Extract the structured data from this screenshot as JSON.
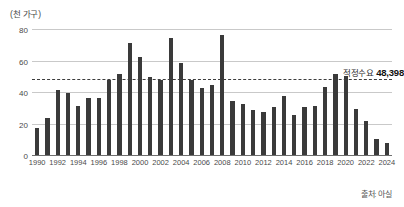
{
  "chart_data": {
    "type": "bar",
    "title": "",
    "subtitle": "",
    "unit_label": "(천 가구)",
    "xlabel": "",
    "ylabel": "",
    "ylim": [
      0,
      80
    ],
    "y_ticks": [
      0,
      20,
      40,
      60,
      80
    ],
    "grid": true,
    "legend_position": "none",
    "x": [
      1990,
      1991,
      1992,
      1993,
      1994,
      1995,
      1996,
      1997,
      1998,
      1999,
      2000,
      2001,
      2002,
      2003,
      2004,
      2005,
      2006,
      2007,
      2008,
      2009,
      2010,
      2011,
      2012,
      2013,
      2014,
      2015,
      2016,
      2017,
      2018,
      2019,
      2020,
      2021,
      2022,
      2023,
      2024
    ],
    "x_tick_labels": [
      "1990",
      "1992",
      "1994",
      "1996",
      "1998",
      "2000",
      "2002",
      "2004",
      "2006",
      "2008",
      "2010",
      "2012",
      "2014",
      "2016",
      "2018",
      "2020",
      "2022",
      "2024"
    ],
    "values": [
      18,
      24,
      42,
      40,
      32,
      37,
      37,
      48,
      52,
      72,
      63,
      50,
      48,
      75,
      59,
      48,
      43,
      45,
      77,
      35,
      33,
      29,
      28,
      31,
      38,
      26,
      31,
      32,
      44,
      52,
      51,
      30,
      22,
      11,
      8
    ],
    "series": [
      {
        "name": "아파트 입주물량",
        "values": [
          18,
          24,
          42,
          40,
          32,
          37,
          37,
          48,
          52,
          72,
          63,
          50,
          48,
          75,
          59,
          48,
          43,
          45,
          77,
          35,
          33,
          29,
          28,
          31,
          38,
          26,
          31,
          32,
          44,
          52,
          51,
          30,
          22,
          11,
          8
        ]
      }
    ],
    "bar_color": "#3a3a3a",
    "annotations": [
      {
        "type": "reference-line",
        "label": "적정수요",
        "value_label": "48,398",
        "value": 48.398,
        "style": "dashed",
        "color": "#3d3d3d"
      }
    ],
    "source": "출처: 아실"
  }
}
